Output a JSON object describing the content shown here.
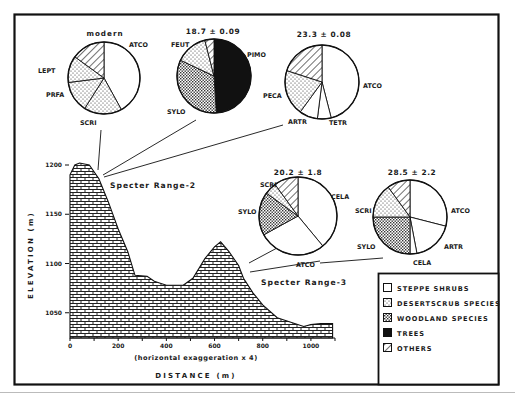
{
  "figure": {
    "frame_color": "#111111",
    "background": "#ffffff"
  },
  "legend": {
    "items": [
      {
        "pattern": "blank",
        "label": "STEPPE SHRUBS"
      },
      {
        "pattern": "dots",
        "label": "DESERTSCRUB SPECIES"
      },
      {
        "pattern": "crosshatch",
        "label": "WOODLAND SPECIES"
      },
      {
        "pattern": "solid",
        "label": "TREES"
      },
      {
        "pattern": "diagonal",
        "label": "OTHERS"
      }
    ]
  },
  "axes": {
    "ylabel": "ELEVATION (m)",
    "xlabel": "DISTANCE (m)",
    "xnote": "(horizontal exaggeration x 4)",
    "yticks": [
      "1200",
      "1150",
      "1100",
      "1050"
    ],
    "xticks": [
      "0",
      "200",
      "400",
      "600",
      "800",
      "1000"
    ]
  },
  "sites": {
    "site1": "Specter Range-2",
    "site2": "Specter Range-3"
  },
  "pies": [
    {
      "title": "modern",
      "labels": [
        "ATCO",
        "LEPT",
        "PRFA",
        "SCRI"
      ]
    },
    {
      "title": "18.7 ± 0.09",
      "labels": [
        "FEUT",
        "PIMO",
        "SYLO"
      ]
    },
    {
      "title": "23.3 ± 0.08",
      "labels": [
        "ATCO",
        "PECA",
        "ARTR",
        "TETR"
      ]
    },
    {
      "title": "20.2 ± 1.8",
      "labels": [
        "SCRI",
        "CELA",
        "SYLO",
        "ATCO"
      ]
    },
    {
      "title": "28.5 ± 2.2",
      "labels": [
        "SCRI",
        "ATCO",
        "SYLO",
        "ARTR",
        "CELA"
      ]
    }
  ],
  "chart_data": {
    "type": "area+pie",
    "title": "",
    "profile": {
      "xlabel": "DISTANCE (m)",
      "ylabel": "ELEVATION (m)",
      "note": "(horizontal exaggeration x 4)",
      "xlim": [
        0,
        1100
      ],
      "ylim": [
        1025,
        1210
      ],
      "xticks": [
        0,
        200,
        400,
        600,
        800,
        1000
      ],
      "yticks": [
        1050,
        1100,
        1150,
        1200
      ],
      "fill_pattern": "woodland-crosshatch",
      "x": [
        0,
        20,
        40,
        80,
        120,
        160,
        200,
        240,
        270,
        320,
        350,
        400,
        470,
        510,
        560,
        600,
        625,
        660,
        700,
        720,
        760,
        800,
        860,
        920,
        970,
        1000,
        1040,
        1090
      ],
      "y": [
        1190,
        1200,
        1202,
        1200,
        1186,
        1162,
        1135,
        1112,
        1088,
        1087,
        1082,
        1078,
        1078,
        1085,
        1105,
        1117,
        1122,
        1112,
        1098,
        1085,
        1070,
        1058,
        1045,
        1040,
        1036,
        1038,
        1039,
        1039
      ],
      "sites": [
        {
          "name": "Specter Range-2",
          "distance": 110,
          "elevation": 1185
        },
        {
          "name": "Specter Range-3",
          "distance": 730,
          "elevation": 1090
        }
      ]
    },
    "pies": [
      {
        "site": "Specter Range-2",
        "age": "modern",
        "slices": [
          {
            "label": "ATCO",
            "group": "STEPPE SHRUBS",
            "value": 42
          },
          {
            "label": "SCRI",
            "group": "DESERTSCRUB SPECIES",
            "value": 17
          },
          {
            "label": "PRFA",
            "group": "DESERTSCRUB SPECIES",
            "value": 14
          },
          {
            "label": "LEPT",
            "group": "DESERTSCRUB SPECIES",
            "value": 12
          },
          {
            "label": "",
            "group": "OTHERS",
            "value": 15
          }
        ]
      },
      {
        "site": "Specter Range-2",
        "age": "18.7 ± 0.09",
        "slices": [
          {
            "label": "PIMO",
            "group": "TREES",
            "value": 49
          },
          {
            "label": "SYLO",
            "group": "WOODLAND SPECIES",
            "value": 33
          },
          {
            "label": "FEUT",
            "group": "DESERTSCRUB SPECIES",
            "value": 14
          },
          {
            "label": "",
            "group": "OTHERS",
            "value": 4
          }
        ]
      },
      {
        "site": "Specter Range-2",
        "age": "23.3 ± 0.08",
        "slices": [
          {
            "label": "ATCO",
            "group": "STEPPE SHRUBS",
            "value": 46
          },
          {
            "label": "TETR",
            "group": "STEPPE SHRUBS",
            "value": 6
          },
          {
            "label": "ARTR",
            "group": "STEPPE SHRUBS",
            "value": 8
          },
          {
            "label": "PECA",
            "group": "DESERTSCRUB SPECIES",
            "value": 20
          },
          {
            "label": "",
            "group": "OTHERS",
            "value": 20
          }
        ]
      },
      {
        "site": "Specter Range-3",
        "age": "20.2 ± 1.8",
        "slices": [
          {
            "label": "CELA",
            "group": "STEPPE SHRUBS",
            "value": 39
          },
          {
            "label": "ATCO",
            "group": "STEPPE SHRUBS",
            "value": 28
          },
          {
            "label": "SYLO",
            "group": "WOODLAND SPECIES",
            "value": 18
          },
          {
            "label": "SCRI",
            "group": "DESERTSCRUB SPECIES",
            "value": 5
          },
          {
            "label": "",
            "group": "OTHERS",
            "value": 10
          }
        ]
      },
      {
        "site": "Specter Range-3",
        "age": "28.5 ± 2.2",
        "slices": [
          {
            "label": "ATCO",
            "group": "STEPPE SHRUBS",
            "value": 29
          },
          {
            "label": "ARTR",
            "group": "STEPPE SHRUBS",
            "value": 18
          },
          {
            "label": "CELA",
            "group": "STEPPE SHRUBS",
            "value": 3
          },
          {
            "label": "SYLO",
            "group": "WOODLAND SPECIES",
            "value": 25
          },
          {
            "label": "SCRI",
            "group": "DESERTSCRUB SPECIES",
            "value": 15
          },
          {
            "label": "",
            "group": "OTHERS",
            "value": 10
          }
        ]
      }
    ],
    "legend": [
      "STEPPE SHRUBS",
      "DESERTSCRUB SPECIES",
      "WOODLAND SPECIES",
      "TREES",
      "OTHERS"
    ],
    "legend_position": "lower-right"
  }
}
